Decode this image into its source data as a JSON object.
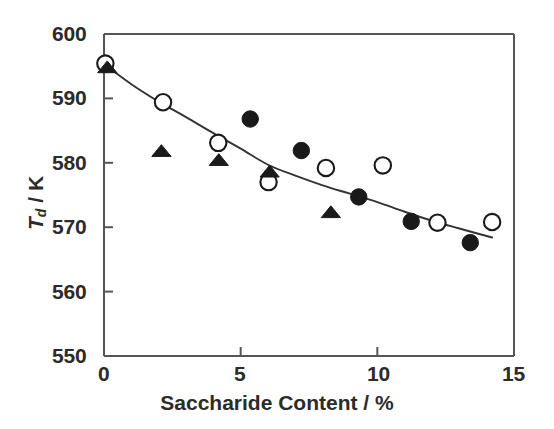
{
  "chart_data": {
    "type": "scatter",
    "title": "",
    "xlabel": "Saccharide Content / %",
    "ylabel": "Td / K",
    "ylabel_base": "T",
    "ylabel_sub": "d",
    "ylabel_unit": " / K",
    "xlim": [
      0,
      15
    ],
    "ylim": [
      550,
      600
    ],
    "xticks": [
      0,
      5,
      10,
      15
    ],
    "yticks": [
      550,
      560,
      570,
      580,
      590,
      600
    ],
    "xtick_labels": [
      "0",
      "5",
      "10",
      "15"
    ],
    "ytick_labels": [
      "550",
      "560",
      "570",
      "580",
      "590",
      "600"
    ],
    "grid": false,
    "legend": "none",
    "marker_color": "#1a1a1a",
    "axis_color": "#555555",
    "curve_color": "#333333",
    "background": "#ffffff",
    "series": [
      {
        "name": "open-circles",
        "marker": "open-circle",
        "points": [
          {
            "x": 0.05,
            "y": 595.4
          },
          {
            "x": 2.16,
            "y": 589.4
          },
          {
            "x": 4.18,
            "y": 583.1
          },
          {
            "x": 6.02,
            "y": 577.0
          },
          {
            "x": 8.12,
            "y": 579.2
          },
          {
            "x": 10.2,
            "y": 579.6
          },
          {
            "x": 12.2,
            "y": 570.7
          },
          {
            "x": 14.2,
            "y": 570.8
          }
        ]
      },
      {
        "name": "filled-circles",
        "marker": "filled-circle",
        "points": [
          {
            "x": 5.35,
            "y": 586.8
          },
          {
            "x": 7.22,
            "y": 581.9
          },
          {
            "x": 9.32,
            "y": 574.7
          },
          {
            "x": 11.24,
            "y": 570.9
          },
          {
            "x": 13.4,
            "y": 567.6
          }
        ]
      },
      {
        "name": "filled-triangles",
        "marker": "filled-triangle",
        "points": [
          {
            "x": 0.12,
            "y": 594.8
          },
          {
            "x": 2.1,
            "y": 581.8
          },
          {
            "x": 4.2,
            "y": 580.4
          },
          {
            "x": 6.06,
            "y": 578.6
          },
          {
            "x": 8.3,
            "y": 572.3
          }
        ]
      }
    ],
    "fit_curve": {
      "name": "trend-line",
      "points": [
        {
          "x": 0.1,
          "y": 595.0
        },
        {
          "x": 1.0,
          "y": 592.2
        },
        {
          "x": 2.0,
          "y": 589.5
        },
        {
          "x": 3.0,
          "y": 587.1
        },
        {
          "x": 4.0,
          "y": 584.6
        },
        {
          "x": 5.0,
          "y": 582.2
        },
        {
          "x": 6.0,
          "y": 579.7
        },
        {
          "x": 7.0,
          "y": 578.0
        },
        {
          "x": 8.0,
          "y": 576.5
        },
        {
          "x": 9.0,
          "y": 575.2
        },
        {
          "x": 10.0,
          "y": 573.9
        },
        {
          "x": 11.0,
          "y": 572.4
        },
        {
          "x": 12.0,
          "y": 571.0
        },
        {
          "x": 13.0,
          "y": 569.8
        },
        {
          "x": 14.2,
          "y": 568.4
        }
      ]
    }
  },
  "axes": {
    "x_tick_0": "0",
    "x_tick_1": "5",
    "x_tick_2": "10",
    "x_tick_3": "15",
    "y_tick_0": "550",
    "y_tick_1": "560",
    "y_tick_2": "570",
    "y_tick_3": "580",
    "y_tick_4": "590",
    "y_tick_5": "600",
    "x_axis_title": "Saccharide Content / %",
    "y_axis_title_base": "T",
    "y_axis_title_sub": "d",
    "y_axis_title_unit": " / K"
  }
}
